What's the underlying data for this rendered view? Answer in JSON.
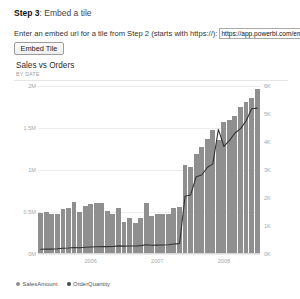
{
  "step": {
    "label": "Step 3",
    "separator": ":",
    "title": "Embed a tile"
  },
  "embed": {
    "instruction": "Enter an embed url for a tile from Step 2 (starts with https://):",
    "url_value": "https://app.powerbi.com/em",
    "url_placeholder": "https://",
    "button_label": "Embed Tile"
  },
  "tile": {
    "title": "Sales vs Orders",
    "subtitle": "BY DATE"
  },
  "legend": [
    {
      "label": "SalesAmount",
      "color": "#8f8f8f",
      "marker": "bar-dot"
    },
    {
      "label": "OrderQuantity",
      "color": "#4a4a4a",
      "marker": "line-dot"
    }
  ],
  "colors": {
    "bar": "#8f8f8f",
    "line": "#333333",
    "grid": "#ececec",
    "axis_text": "#a8a8a8"
  },
  "chart_data": {
    "type": "bar",
    "title": "Sales vs Orders",
    "subtitle": "BY DATE",
    "xlabel": "",
    "ylabel": "SalesAmount",
    "y2label": "OrderQuantity",
    "grid": true,
    "legend_position": "bottom-left",
    "ylim": [
      0,
      2000000
    ],
    "y2lim": [
      0,
      6000
    ],
    "yticks": [
      0,
      500000,
      1000000,
      1500000,
      2000000
    ],
    "ytick_labels": [
      "0M",
      "0.5M",
      "1M",
      "1.5M",
      "2M"
    ],
    "y2ticks": [
      0,
      1000,
      2000,
      3000,
      4000,
      5000,
      6000
    ],
    "y2tick_labels": [
      "0K",
      "1K",
      "2K",
      "3K",
      "4K",
      "5K",
      "6K"
    ],
    "xtick_labels": [
      "2006",
      "2007",
      "2008"
    ],
    "xtick_positions": [
      9,
      21,
      33
    ],
    "categories": [
      "2005-07",
      "2005-08",
      "2005-09",
      "2005-10",
      "2005-11",
      "2005-12",
      "2006-01",
      "2006-02",
      "2006-03",
      "2006-04",
      "2006-05",
      "2006-06",
      "2006-07",
      "2006-08",
      "2006-09",
      "2006-10",
      "2006-11",
      "2006-12",
      "2007-01",
      "2007-02",
      "2007-03",
      "2007-04",
      "2007-05",
      "2007-06",
      "2007-07",
      "2007-08",
      "2007-09",
      "2007-10",
      "2007-11",
      "2007-12",
      "2008-01",
      "2008-02",
      "2008-03",
      "2008-04",
      "2008-05",
      "2008-06",
      "2008-07",
      "2008-08",
      "2008-09",
      "2008-10"
    ],
    "series": [
      {
        "name": "SalesAmount",
        "type": "bar",
        "axis": "left",
        "color": "#8f8f8f",
        "values": [
          489000,
          506000,
          474000,
          482000,
          538000,
          552000,
          615000,
          498000,
          570000,
          592000,
          604000,
          602000,
          508000,
          478000,
          545000,
          380000,
          425000,
          370000,
          434000,
          602000,
          456000,
          475000,
          480000,
          476000,
          545000,
          560000,
          1060000,
          1030000,
          1195000,
          1270000,
          1375000,
          1480000,
          1355000,
          1570000,
          1600000,
          1640000,
          1745000,
          1810000,
          1855000,
          1965000
        ]
      },
      {
        "name": "OrderQuantity",
        "type": "line",
        "axis": "right",
        "color": "#333333",
        "values": [
          170,
          180,
          175,
          185,
          205,
          215,
          230,
          225,
          240,
          250,
          258,
          262,
          265,
          268,
          290,
          282,
          286,
          288,
          300,
          330,
          315,
          318,
          322,
          330,
          355,
          372,
          2060,
          2110,
          2760,
          2820,
          3090,
          3220,
          4450,
          3840,
          4060,
          4320,
          4480,
          4760,
          5190,
          5210
        ]
      }
    ]
  }
}
